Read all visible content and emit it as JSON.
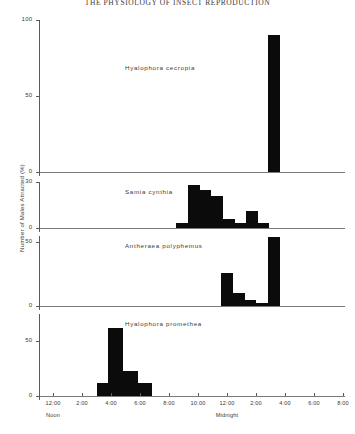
{
  "figure": {
    "title": "THE PHYSIOLOGY OF INSECT REPRODUCTION",
    "ylabel": "Number of Males Attracted (%)"
  },
  "chart_data": {
    "type": "bar",
    "title": "THE PHYSIOLOGY OF INSECT REPRODUCTION",
    "xlabel": "",
    "ylabel": "Number of Males Attracted (%)",
    "grid": false,
    "legend": null,
    "x_tick_labels": [
      "12:00",
      "2:00",
      "4:00",
      "6:00",
      "8:00",
      "10:00",
      "12:00",
      "2:00",
      "4:00",
      "6:00",
      "8:00"
    ],
    "x_tick_hours": [
      12,
      14,
      16,
      18,
      20,
      22,
      24,
      26,
      28,
      30,
      32
    ],
    "x_day_markers": [
      {
        "label": "Noon",
        "hour": 12
      },
      {
        "label": "Midnight",
        "hour": 24
      }
    ],
    "xlim_hours": [
      11,
      32
    ],
    "panels": [
      {
        "species": "Hyalophora cecropia",
        "ylim": [
          0,
          100
        ],
        "yticks": [
          0,
          50,
          100
        ],
        "ytick_labels": [
          "0",
          "50",
          "100"
        ],
        "bars": [
          {
            "start_hour": 26.8,
            "end_hour": 27.6,
            "value": 90
          }
        ]
      },
      {
        "species": "Samia cynthia",
        "ylim": [
          0,
          30
        ],
        "yticks": [
          0,
          30
        ],
        "ytick_labels": [
          "0",
          "30"
        ],
        "bars": [
          {
            "start_hour": 20.5,
            "end_hour": 21.3,
            "value": 3
          },
          {
            "start_hour": 21.3,
            "end_hour": 22.1,
            "value": 28
          },
          {
            "start_hour": 22.1,
            "end_hour": 22.9,
            "value": 25
          },
          {
            "start_hour": 22.9,
            "end_hour": 23.7,
            "value": 21
          },
          {
            "start_hour": 23.7,
            "end_hour": 24.5,
            "value": 6
          },
          {
            "start_hour": 24.5,
            "end_hour": 25.3,
            "value": 3
          },
          {
            "start_hour": 25.3,
            "end_hour": 26.1,
            "value": 11
          },
          {
            "start_hour": 26.1,
            "end_hour": 26.9,
            "value": 3
          }
        ]
      },
      {
        "species": "Antheraea polyphemus",
        "ylim": [
          0,
          55
        ],
        "yticks": [
          0,
          50
        ],
        "ytick_labels": [
          "0",
          "50"
        ],
        "bars": [
          {
            "start_hour": 23.6,
            "end_hour": 24.4,
            "value": 26
          },
          {
            "start_hour": 24.4,
            "end_hour": 25.2,
            "value": 10
          },
          {
            "start_hour": 25.2,
            "end_hour": 26.0,
            "value": 5
          },
          {
            "start_hour": 26.0,
            "end_hour": 26.8,
            "value": 2
          },
          {
            "start_hour": 26.8,
            "end_hour": 27.6,
            "value": 54
          }
        ]
      },
      {
        "species": "Hyalophora promethea",
        "ylim": [
          0,
          75
        ],
        "yticks": [
          0,
          50
        ],
        "ytick_labels": [
          "0",
          "50"
        ],
        "bars": [
          {
            "start_hour": 15.0,
            "end_hour": 15.8,
            "value": 12
          },
          {
            "start_hour": 15.8,
            "end_hour": 16.8,
            "value": 62
          },
          {
            "start_hour": 16.8,
            "end_hour": 17.8,
            "value": 23
          },
          {
            "start_hour": 17.8,
            "end_hour": 18.8,
            "value": 12
          }
        ]
      }
    ]
  }
}
